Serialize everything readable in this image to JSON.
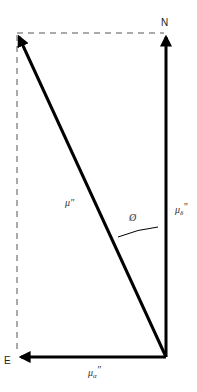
{
  "diagram": {
    "labels": {
      "north": "N",
      "east": "E",
      "total_motion": "μ\"",
      "angle": "Ø",
      "dec_component_base": "μ",
      "dec_component_sub": "δ",
      "dec_component_suffix": "\"",
      "ra_component_base": "μ",
      "ra_component_sub": "α",
      "ra_component_suffix": "\""
    },
    "colors": {
      "vector": "#000000",
      "dashed_guide": "#555555",
      "text": "#222222",
      "background": "#ffffff"
    }
  }
}
